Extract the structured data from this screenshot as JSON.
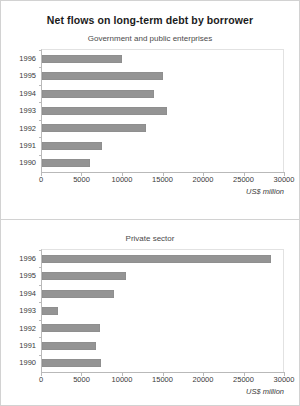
{
  "chart_data": {
    "type": "bar",
    "title": "Net flows on long-term debt by borrower",
    "orientation": "horizontal",
    "xlabel": "US$ million",
    "ylabel": "",
    "xlim": [
      0,
      30000
    ],
    "xticks": [
      0,
      5000,
      10000,
      15000,
      20000,
      25000,
      30000
    ],
    "xtick_labels": [
      "0",
      "5000",
      "10000",
      "15000",
      "20000",
      "25000",
      "30000"
    ],
    "grid": false,
    "legend": "none",
    "bar_color": "#949494",
    "panels": [
      {
        "subtitle": "Government and public enterprises",
        "categories": [
          "1996",
          "1995",
          "1994",
          "1993",
          "1992",
          "1991",
          "1990"
        ],
        "values": [
          10000,
          15000,
          14000,
          15500,
          13000,
          7500,
          6000
        ],
        "axis_caption": "US$ million"
      },
      {
        "subtitle": "Private sector",
        "categories": [
          "1996",
          "1995",
          "1994",
          "1993",
          "1992",
          "1991",
          "1990"
        ],
        "values": [
          28500,
          10500,
          9000,
          2000,
          7200,
          6700,
          7300
        ],
        "axis_caption": "US$ million"
      }
    ]
  }
}
